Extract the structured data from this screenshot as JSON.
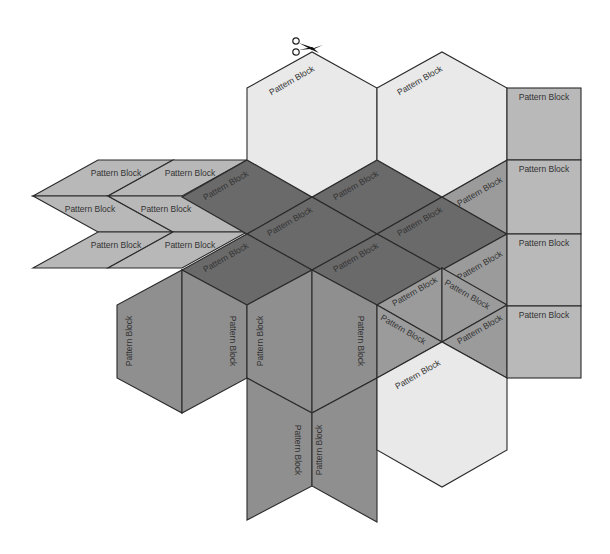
{
  "diagram": {
    "title": "",
    "cut_icon": "scissors-icon",
    "label_default": "Pattern Block",
    "colors": {
      "hexagon": "#e9e9e9",
      "thin_rhombus": "#b8b8b8",
      "square": "#b9b9b9",
      "wide_rhombus_dark": "#6a6a6a",
      "wide_rhombus_medium": "#8f8f8f",
      "triangle": "#9b9b9b",
      "outline": "#2a2a2a"
    },
    "hexagons": [
      {
        "label": "Pattern Block",
        "points": "247,88 312,52 377,88 377,160 312,197 247,160",
        "text_x": 292,
        "text_y": 81,
        "rotate": -30
      },
      {
        "label": "Pattern Block",
        "points": "377,88 442,52 507,88 507,160 442,197 377,160",
        "text_x": 420,
        "text_y": 81,
        "rotate": -30
      },
      {
        "label": "Pattern Block",
        "points": "377,378 442,342 507,378 507,450 442,487 377,450",
        "text_x": 418,
        "text_y": 375,
        "rotate": -30
      }
    ],
    "squares": [
      {
        "label": "Pattern Block",
        "x": 507,
        "y": 88,
        "w": 74,
        "h": 72
      },
      {
        "label": "Pattern Block",
        "x": 507,
        "y": 160,
        "w": 74,
        "h": 74
      },
      {
        "label": "Pattern Block",
        "x": 507,
        "y": 234,
        "w": 74,
        "h": 72
      },
      {
        "label": "Pattern Block",
        "x": 507,
        "y": 306,
        "w": 74,
        "h": 72
      }
    ],
    "thin_rhombi": [
      {
        "label": "Pattern Block",
        "points": "98,160 173,160 108,196 33,196",
        "text_x": 116,
        "text_y": 174
      },
      {
        "label": "Pattern Block",
        "points": "173,160 247,160 182,196 108,196",
        "text_x": 190,
        "text_y": 174
      },
      {
        "label": "Pattern Block",
        "points": "33,196 108,196 173,232 98,232",
        "text_x": 90,
        "text_y": 210
      },
      {
        "label": "Pattern Block",
        "points": "108,196 182,196 247,232 173,232",
        "text_x": 166,
        "text_y": 210
      },
      {
        "label": "Pattern Block",
        "points": "98,232 173,232 108,268 33,268",
        "text_x": 116,
        "text_y": 246
      },
      {
        "label": "Pattern Block",
        "points": "173,232 247,232 182,268 108,268",
        "text_x": 190,
        "text_y": 246
      }
    ],
    "dark_rhombi": [
      {
        "label": "Pattern Block",
        "points": "182,197 247,160 312,197 247,234",
        "text_x": 226,
        "text_y": 186,
        "rotate": -30
      },
      {
        "label": "Pattern Block",
        "points": "312,197 377,160 442,197 377,234",
        "text_x": 356,
        "text_y": 186,
        "rotate": -30
      },
      {
        "label": "Pattern Block",
        "points": "247,234 312,197 377,234 312,270",
        "text_x": 290,
        "text_y": 222,
        "rotate": -30
      },
      {
        "label": "Pattern Block",
        "points": "377,234 442,197 507,234 442,270",
        "text_x": 420,
        "text_y": 222,
        "rotate": -30
      },
      {
        "label": "Pattern Block",
        "points": "182,270 247,234 312,270 247,305",
        "text_x": 226,
        "text_y": 258,
        "rotate": -30
      },
      {
        "label": "Pattern Block",
        "points": "312,270 377,234 442,270 377,305",
        "text_x": 356,
        "text_y": 258,
        "rotate": -30
      }
    ],
    "medium_rhombi": [
      {
        "label": "Pattern Block",
        "points": "182,270 182,413 117,378 117,305",
        "text_x": 130,
        "text_y": 341,
        "rotate": -90
      },
      {
        "label": "Pattern Block",
        "points": "182,270 247,305 247,378 182,413",
        "text_x": 232,
        "text_y": 341,
        "rotate": 90
      },
      {
        "label": "Pattern Block",
        "points": "247,305 312,270 312,413 247,378",
        "text_x": 261,
        "text_y": 341,
        "rotate": -90
      },
      {
        "label": "Pattern Block",
        "points": "312,270 377,305 377,378 312,413",
        "text_x": 360,
        "text_y": 341,
        "rotate": 90
      },
      {
        "label": "Pattern Block",
        "points": "247,378 312,413 312,486 247,520",
        "text_x": 297,
        "text_y": 450,
        "rotate": 90
      },
      {
        "label": "Pattern Block",
        "points": "312,413 377,378 377,522 312,486",
        "text_x": 320,
        "text_y": 450,
        "rotate": -90
      }
    ],
    "triangles": [
      {
        "label": "Pattern Block",
        "points": "442,197 507,160 507,234",
        "text_x": 480,
        "text_y": 192,
        "rotate": -30
      },
      {
        "label": "Pattern Block",
        "points": "442,270 507,234 507,305",
        "text_x": 480,
        "text_y": 266,
        "rotate": -30
      },
      {
        "label": "Pattern Block",
        "points": "377,305 442,268 442,342",
        "text_x": 415,
        "text_y": 292,
        "rotate": -30
      },
      {
        "label": "Pattern Block",
        "points": "442,268 507,305 442,342",
        "text_x": 467,
        "text_y": 295,
        "rotate": 30
      },
      {
        "label": "Pattern Block",
        "points": "377,305 442,342 377,378",
        "text_x": 403,
        "text_y": 330,
        "rotate": 30
      },
      {
        "label": "Pattern Block",
        "points": "442,342 507,305 507,378",
        "text_x": 480,
        "text_y": 330,
        "rotate": -30
      }
    ]
  }
}
